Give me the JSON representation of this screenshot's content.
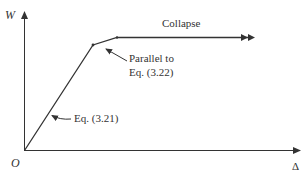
{
  "diagram": {
    "type": "load-displacement curve",
    "axes": {
      "y_label": "W",
      "x_label": "Δ",
      "origin_label": "O"
    },
    "curve": {
      "segments": [
        {
          "name": "elastic",
          "from": "O",
          "description": "initial linear branch"
        },
        {
          "name": "post-yield",
          "description": "hardening branch"
        },
        {
          "name": "collapse",
          "description": "horizontal plateau"
        }
      ]
    },
    "annotations": {
      "collapse": "Collapse",
      "parallel_line1": "Parallel to",
      "parallel_line2": "Eq. (3.22)",
      "elastic_eq": "Eq. (3.21)"
    },
    "colors": {
      "line": "#333333",
      "background": "#ffffff"
    }
  }
}
